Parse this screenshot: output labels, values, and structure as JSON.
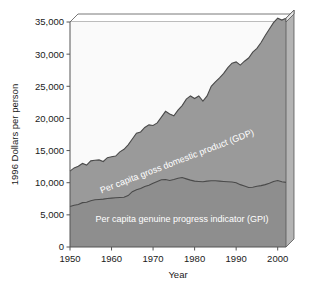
{
  "chart_data": {
    "type": "area",
    "title": "",
    "xlabel": "Year",
    "ylabel": "1996 Dollars per person",
    "xlim": [
      1950,
      2002
    ],
    "ylim": [
      0,
      35000
    ],
    "xticks": [
      "1950",
      "1960",
      "1970",
      "1980",
      "1990",
      "2000"
    ],
    "xtick_values": [
      1950,
      1960,
      1970,
      1980,
      1990,
      2000
    ],
    "yticks": [
      "0",
      "5,000",
      "10,000",
      "15,000",
      "20,000",
      "25,000",
      "30,000",
      "35,000"
    ],
    "ytick_values": [
      0,
      5000,
      10000,
      15000,
      20000,
      25000,
      30000,
      35000
    ],
    "grid": false,
    "legend_position": "inline-on-series",
    "stacked": false,
    "x": [
      1950,
      1951,
      1952,
      1953,
      1954,
      1955,
      1956,
      1957,
      1958,
      1959,
      1960,
      1961,
      1962,
      1963,
      1964,
      1965,
      1966,
      1967,
      1968,
      1969,
      1970,
      1971,
      1972,
      1973,
      1974,
      1975,
      1976,
      1977,
      1978,
      1979,
      1980,
      1981,
      1982,
      1983,
      1984,
      1985,
      1986,
      1987,
      1988,
      1989,
      1990,
      1991,
      1992,
      1993,
      1994,
      1995,
      1996,
      1997,
      1998,
      1999,
      2000,
      2001,
      2002
    ],
    "series": [
      {
        "name": "Per capita gross domestic product (GDP)",
        "label": "Per capita gross domestic product (GDP)",
        "color": "#9a9a9a",
        "values": [
          11800,
          12300,
          12550,
          13000,
          12750,
          13400,
          13500,
          13550,
          13300,
          13900,
          14050,
          14150,
          14800,
          15200,
          15900,
          16800,
          17700,
          17900,
          18600,
          19000,
          18900,
          19300,
          20200,
          21100,
          20700,
          20400,
          21300,
          22000,
          23000,
          23500,
          23100,
          23500,
          22700,
          23500,
          25000,
          25700,
          26300,
          27000,
          27900,
          28600,
          28800,
          28300,
          28900,
          29400,
          30300,
          30900,
          31800,
          32900,
          33900,
          34900,
          35600,
          35300,
          35600
        ],
        "right_edge_value": 34600,
        "start_value": 11800
      },
      {
        "name": "Per capita genuine progress indicator (GPI)",
        "label": "Per capita genuine progress indicator (GPI)",
        "color": "#8e8e8e",
        "values": [
          6300,
          6500,
          6600,
          6900,
          6950,
          7200,
          7350,
          7400,
          7450,
          7550,
          7600,
          7650,
          7700,
          7750,
          8000,
          8600,
          8900,
          9100,
          9400,
          9600,
          9900,
          10200,
          10450,
          10500,
          10350,
          10500,
          10700,
          10800,
          10600,
          10400,
          10250,
          10200,
          10150,
          10250,
          10300,
          10300,
          10250,
          10200,
          10150,
          10100,
          10000,
          9700,
          9500,
          9250,
          9300,
          9450,
          9550,
          9700,
          9900,
          10200,
          10350,
          10150,
          10050
        ],
        "start_value": 6300
      }
    ],
    "annotations": [
      {
        "text": "Per capita gross domestic product (GDP)",
        "placement": "along-gdp-boundary",
        "rotation_deg": -21
      },
      {
        "text": "Per capita genuine progress indicator (GPI)",
        "placement": "below-gpi-curve",
        "rotation_deg": 0
      }
    ],
    "style": {
      "plot_background": "#fafafa",
      "gdp_fill": "#9a9a9a",
      "gpi_fill": "#8e8e8e",
      "side_panel_fill": "#b4b4b4",
      "top_panel_fill": "#ffffff",
      "line_color": "#4a4a4a",
      "axis_color": "#555555",
      "three_d": true,
      "depth_x": 8,
      "depth_y": 8
    }
  }
}
